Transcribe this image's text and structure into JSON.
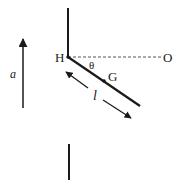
{
  "diagram": {
    "labels": {
      "pivot": "H",
      "horizontal_end": "O",
      "angle": "θ",
      "center_of_mass": "G",
      "length": "l",
      "acceleration": "a"
    },
    "colors": {
      "stroke": "#1a1a1a",
      "dashed": "#555555",
      "background": "#ffffff"
    }
  }
}
